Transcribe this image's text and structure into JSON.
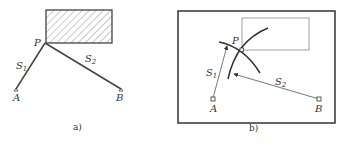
{
  "panel_a": {
    "caption": "a)",
    "point_P": "P",
    "point_A": "A",
    "point_B": "B",
    "segment_1": {
      "letter": "S",
      "sub": "1"
    },
    "segment_2": {
      "letter": "S",
      "sub": "2"
    }
  },
  "panel_b": {
    "caption": "b)",
    "point_P": "P",
    "point_A": "A",
    "point_B": "B",
    "segment_1": {
      "letter": "S",
      "sub": "1"
    },
    "segment_2": {
      "letter": "S",
      "sub": "2"
    }
  },
  "colors": {
    "line": "#444444",
    "hatch": "#666666"
  }
}
